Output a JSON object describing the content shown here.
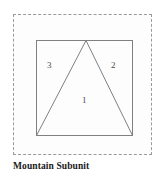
{
  "figure": {
    "caption": "Mountain Subunit",
    "frame": {
      "style": "dashed",
      "color": "#9a9a9a",
      "background": "#fdfdfd"
    },
    "stroke_color": "#808080",
    "shapes": [
      {
        "name": "square",
        "kind": "rectangle",
        "x": 36,
        "y": 40,
        "width": 97,
        "height": 96
      },
      {
        "name": "triangle",
        "kind": "polygon",
        "points": "36,136 86,40 133,136"
      }
    ],
    "labels": [
      {
        "id": "1",
        "text": "1",
        "region": "triangle-interior"
      },
      {
        "id": "2",
        "text": "2",
        "region": "right-corner"
      },
      {
        "id": "3",
        "text": "3",
        "region": "left-corner"
      }
    ]
  }
}
